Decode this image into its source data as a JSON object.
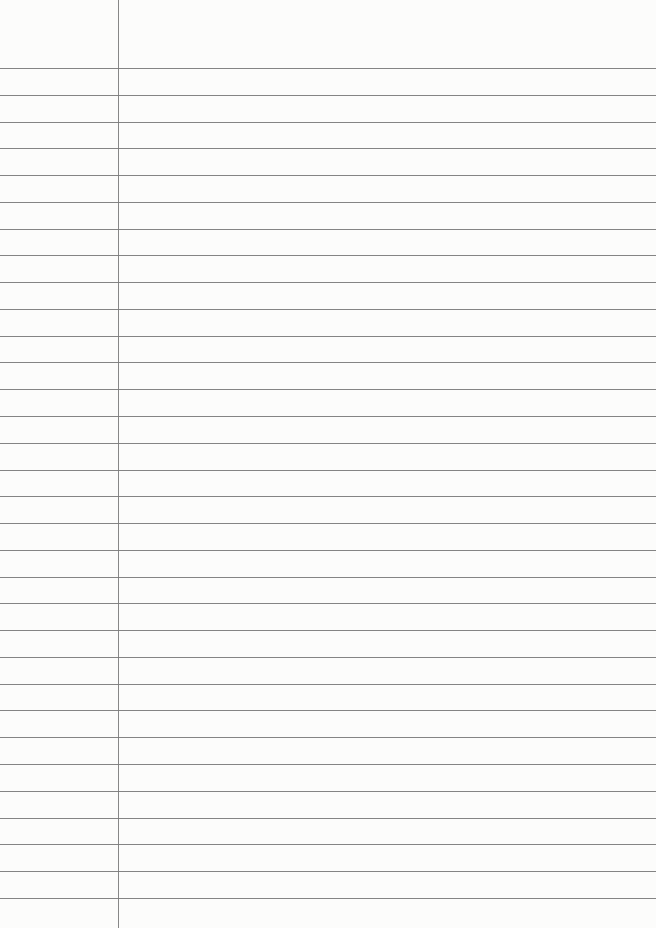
{
  "paper": {
    "type": "lined-paper",
    "background_color": "#fcfcfb",
    "rule_color": "#6e6e6e",
    "margin_color": "#7a7a7a",
    "margin_x": 118,
    "first_rule_y": 68,
    "rule_spacing": 26.77,
    "rule_count": 32
  }
}
